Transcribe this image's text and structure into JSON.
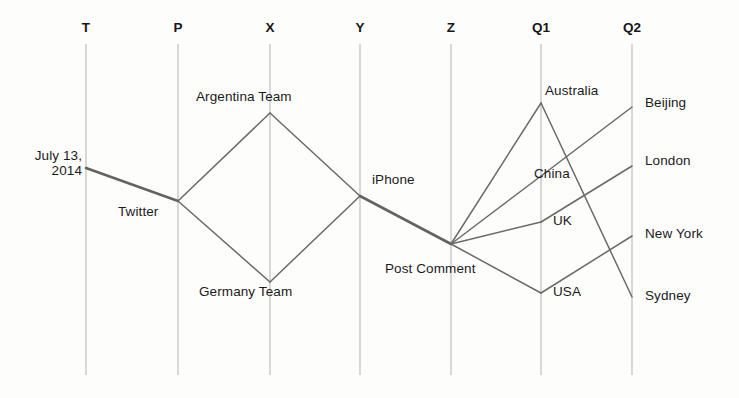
{
  "diagram": {
    "background_color": "#fdfdfc",
    "axis_color": "#b9b9b6",
    "edge_color": "#6a6a66",
    "text_color": "#1b1b1b",
    "axes": [
      {
        "id": "T",
        "label": "T",
        "x": 86
      },
      {
        "id": "P",
        "label": "P",
        "x": 178
      },
      {
        "id": "X",
        "label": "X",
        "x": 270
      },
      {
        "id": "Y",
        "label": "Y",
        "x": 360
      },
      {
        "id": "Z",
        "label": "Z",
        "x": 451
      },
      {
        "id": "Q1",
        "label": "Q1",
        "x": 541
      },
      {
        "id": "Q2",
        "label": "Q2",
        "x": 632
      }
    ],
    "axis_top_y": 44,
    "axis_bottom_y": 375,
    "nodes": [
      {
        "id": "july13",
        "label": "July 13,\n2014",
        "axis": "T",
        "x": 86,
        "y": 168,
        "label_x": 25,
        "label_y": 148,
        "align": "right",
        "label_w": 57
      },
      {
        "id": "twitter",
        "label": "Twitter",
        "axis": "P",
        "x": 178,
        "y": 201,
        "label_x": 118,
        "label_y": 204,
        "align": "left",
        "label_w": 0
      },
      {
        "id": "argentina",
        "label": "Argentina Team",
        "axis": "X",
        "x": 270,
        "y": 113,
        "label_x": 196,
        "label_y": 89,
        "align": "left",
        "label_w": 0
      },
      {
        "id": "germany",
        "label": "Germany Team",
        "axis": "X",
        "x": 270,
        "y": 282,
        "label_x": 199,
        "label_y": 284,
        "align": "left",
        "label_w": 0
      },
      {
        "id": "iphone",
        "label": "iPhone",
        "axis": "Y",
        "x": 360,
        "y": 196,
        "label_x": 372,
        "label_y": 172,
        "align": "left",
        "label_w": 0
      },
      {
        "id": "postcomment",
        "label": "Post Comment",
        "axis": "Z",
        "x": 451,
        "y": 244,
        "label_x": 385,
        "label_y": 261,
        "align": "left",
        "label_w": 0
      },
      {
        "id": "australia",
        "label": "Australia",
        "axis": "Q1",
        "x": 541,
        "y": 103,
        "label_x": 545,
        "label_y": 83,
        "align": "left",
        "label_w": 0
      },
      {
        "id": "china",
        "label": "China",
        "axis": "Q1",
        "x": 541,
        "y": 176,
        "label_x": 534,
        "label_y": 166,
        "align": "left",
        "label_w": 0
      },
      {
        "id": "uk",
        "label": "UK",
        "axis": "Q1",
        "x": 541,
        "y": 222,
        "label_x": 553,
        "label_y": 213,
        "align": "left",
        "label_w": 0
      },
      {
        "id": "usa",
        "label": "USA",
        "axis": "Q1",
        "x": 541,
        "y": 293,
        "label_x": 553,
        "label_y": 284,
        "align": "left",
        "label_w": 0
      },
      {
        "id": "beijing",
        "label": "Beijing",
        "axis": "Q2",
        "x": 632,
        "y": 107,
        "label_x": 645,
        "label_y": 95,
        "align": "left",
        "label_w": 0
      },
      {
        "id": "london",
        "label": "London",
        "axis": "Q2",
        "x": 632,
        "y": 166,
        "label_x": 645,
        "label_y": 153,
        "align": "left",
        "label_w": 0
      },
      {
        "id": "newyork",
        "label": "New York",
        "axis": "Q2",
        "x": 632,
        "y": 236,
        "label_x": 645,
        "label_y": 226,
        "align": "left",
        "label_w": 0
      },
      {
        "id": "sydney",
        "label": "Sydney",
        "axis": "Q2",
        "x": 632,
        "y": 297,
        "label_x": 645,
        "label_y": 288,
        "align": "left",
        "label_w": 0
      }
    ],
    "edges": [
      {
        "from": "july13",
        "to": "twitter",
        "weight": "thick"
      },
      {
        "from": "twitter",
        "to": "argentina",
        "weight": "normal"
      },
      {
        "from": "twitter",
        "to": "germany",
        "weight": "normal"
      },
      {
        "from": "argentina",
        "to": "iphone",
        "weight": "normal"
      },
      {
        "from": "germany",
        "to": "iphone",
        "weight": "normal"
      },
      {
        "from": "iphone",
        "to": "postcomment",
        "weight": "thick"
      },
      {
        "from": "postcomment",
        "to": "australia",
        "weight": "normal"
      },
      {
        "from": "postcomment",
        "to": "china",
        "weight": "normal"
      },
      {
        "from": "postcomment",
        "to": "uk",
        "weight": "normal"
      },
      {
        "from": "postcomment",
        "to": "usa",
        "weight": "normal"
      },
      {
        "from": "australia",
        "to": "sydney",
        "weight": "normal"
      },
      {
        "from": "china",
        "to": "beijing",
        "weight": "normal"
      },
      {
        "from": "uk",
        "to": "london",
        "weight": "normal"
      },
      {
        "from": "usa",
        "to": "newyork",
        "weight": "normal"
      }
    ]
  }
}
